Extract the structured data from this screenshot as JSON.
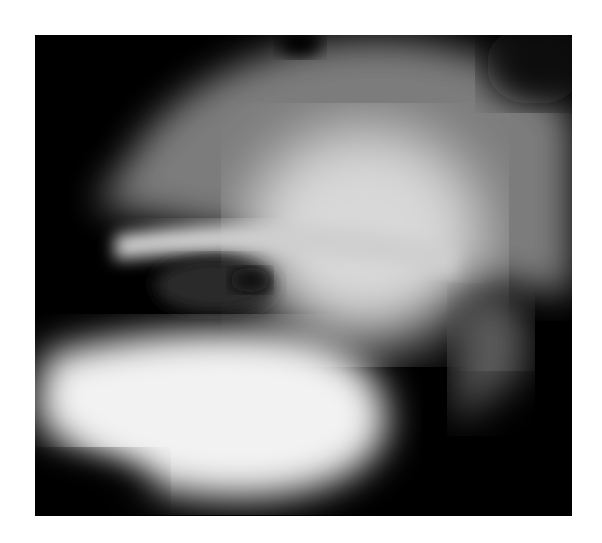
{
  "image": {
    "subject": "lateral radiograph of jaw/skull region",
    "background_color": "#ffffff",
    "frame_color": "#000000"
  }
}
